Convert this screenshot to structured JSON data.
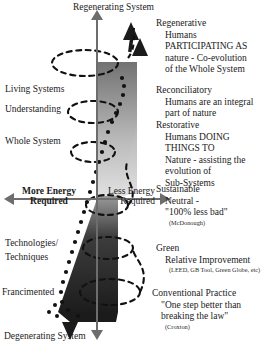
{
  "diagram": {
    "title_top": "Regenerating System",
    "title_bottom": "Degenerating System",
    "axis": {
      "vertical_top": "Regenerating System",
      "vertical_bottom": "Degenerating System",
      "horizontal_left_line1": "More Energy",
      "horizontal_left_line2": "Required",
      "horizontal_right_line1": "Less Energy",
      "horizontal_right_line2": "Required"
    },
    "left_labels": [
      {
        "id": "living-systems",
        "text": "Living Systems"
      },
      {
        "id": "understanding",
        "text": "Understanding"
      },
      {
        "id": "whole-system",
        "text": "Whole System"
      },
      {
        "id": "technologies-line1",
        "text": "Technologies/"
      },
      {
        "id": "technologies-line2",
        "text": "Techniques"
      },
      {
        "id": "fragmented",
        "text": "Francimented"
      }
    ],
    "levels": [
      {
        "id": "regenerative",
        "heading": "Regenerative",
        "lines": [
          "Humans",
          "PARTICIPATING AS",
          "nature - Co-evolution",
          "of the Whole System"
        ],
        "source": ""
      },
      {
        "id": "reconciliatory",
        "heading": "Reconciliatory",
        "lines": [
          "Humans are an integral",
          "part of nature"
        ],
        "source": ""
      },
      {
        "id": "restorative",
        "heading": "Restorative",
        "lines": [
          "Humans DOING",
          "THINGS TO",
          "Nature - assisting the",
          "evolution of",
          "Sub-Systems"
        ],
        "source": ""
      },
      {
        "id": "sustainable",
        "heading": "Sustainable",
        "lines": [
          "Neutral -",
          "\"100% less bad\""
        ],
        "source": "(McDonough)"
      },
      {
        "id": "green",
        "heading": "Green",
        "lines": [
          "Relative Improvement"
        ],
        "source": "(LEED, GB Tool, Green Globe, etc)"
      },
      {
        "id": "conventional-practice",
        "heading": "Conventional Practice",
        "lines": [
          "\"One step better than",
          "breaking the law\""
        ],
        "source": "(Croxton)"
      }
    ],
    "colors": {
      "axis": "#6d6d6d",
      "cone_dark": "#2b2b2b",
      "cone_light": "#d8d8d8",
      "spiral": "#111111",
      "text": "#1a1a1a"
    }
  }
}
